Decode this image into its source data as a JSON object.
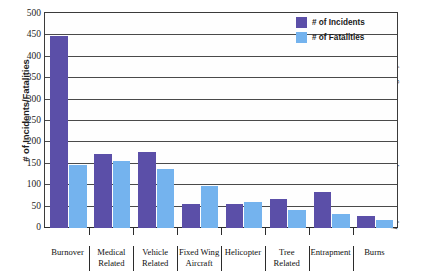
{
  "chart_data": {
    "type": "bar",
    "title": "",
    "xlabel": "",
    "ylabel": "# of Incidents/Fatalities",
    "ylim": [
      0,
      500
    ],
    "ytick_step": 50,
    "yticks": [
      500,
      450,
      400,
      350,
      300,
      250,
      200,
      150,
      100,
      50,
      0
    ],
    "grid": true,
    "legend_position": "top-right",
    "categories": [
      "Burnover",
      "Medical Related",
      "Vehicle Related",
      "Fixed Wing Aircraft",
      "Helicopter",
      "Tree Related",
      "Entrapment",
      "Burns"
    ],
    "category_lines": [
      [
        "Burnover"
      ],
      [
        "Medical",
        "Related"
      ],
      [
        "Vehicle",
        "Related"
      ],
      [
        "Fixed Wing",
        "Aircraft"
      ],
      [
        "Helicopter"
      ],
      [
        "Tree",
        "Related"
      ],
      [
        "Entrapment"
      ],
      [
        "Burns"
      ]
    ],
    "series": [
      {
        "name": "# of Incidents",
        "color": "#5b4fa8",
        "values": [
          449,
          173,
          178,
          57,
          57,
          68,
          86,
          29
        ]
      },
      {
        "name": "# of Fatalities",
        "color": "#74b3ee",
        "values": [
          148,
          157,
          138,
          100,
          62,
          43,
          33,
          19
        ]
      }
    ],
    "annotation": "Information taken from the National Interagency Fire Center."
  },
  "legend": {
    "items": [
      {
        "label": "# of Incidents",
        "swatch": "incidents"
      },
      {
        "label": "# of Fatalities",
        "swatch": "fatalities"
      }
    ]
  }
}
